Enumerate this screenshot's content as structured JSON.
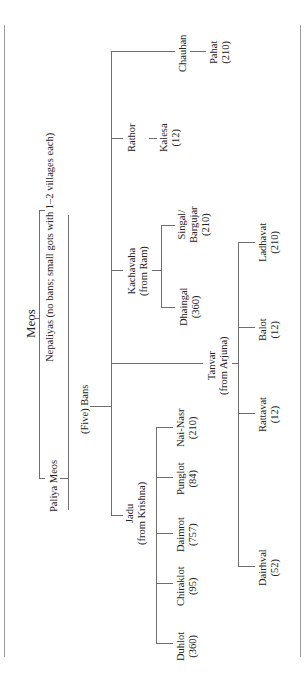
{
  "diagram": {
    "title": "Meos",
    "root": "Meos",
    "groups": {
      "nepaliyas": "Nepaliyas (no bans; small gots with 1–2 villages each)",
      "paliya": "Paliya Meos",
      "five_bans": "(Five) Bans"
    },
    "bans": {
      "chauhan": {
        "name": "Chauhan",
        "children": [
          {
            "name": "Pahat",
            "count": "(210)"
          }
        ]
      },
      "rathor": {
        "name": "Rathor",
        "children": [
          {
            "name": "Kalesa",
            "count": "(12)"
          }
        ]
      },
      "kachavaha": {
        "name": "Kachavaha",
        "origin": "(from Ram)",
        "children": [
          {
            "name": "Singal/",
            "name2": "Bargujar",
            "count": "(210)"
          },
          {
            "name": "Dhaingal",
            "count": "(360)"
          }
        ]
      },
      "tanvar": {
        "name": "Tanvar",
        "origin": "(from Arjuna)",
        "children": [
          {
            "name": "Ladhavat",
            "count": "(210)"
          },
          {
            "name": "Balot",
            "count": "(12)"
          },
          {
            "name": "Rattavat",
            "count": "(12)"
          },
          {
            "name": "Dairhval",
            "count": "(52)"
          }
        ]
      },
      "jadu": {
        "name": "Jadu",
        "origin": "(from Krishna)",
        "children": [
          {
            "name": "Nai-Nasr",
            "count": "(210)"
          },
          {
            "name": "Punglot",
            "count": "(84)"
          },
          {
            "name": "Daimrot",
            "count": "(757)"
          },
          {
            "name": "Chiraklot",
            "count": "(95)"
          },
          {
            "name": "Duhlot",
            "count": "(360)"
          }
        ]
      }
    }
  }
}
